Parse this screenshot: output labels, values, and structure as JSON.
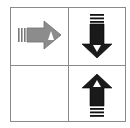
{
  "grid": {
    "rows": 2,
    "cols": 2,
    "border_color": "#8a8a8a",
    "background": "#ffffff"
  },
  "cells": [
    {
      "row": 0,
      "col": 0,
      "icon": "arrow-right-icon",
      "direction": "right",
      "fill": "#8c8c8c",
      "stroke": "#6e6e6e"
    },
    {
      "row": 0,
      "col": 1,
      "icon": "arrow-down-icon",
      "direction": "down",
      "fill": "#1a1a1a",
      "stroke": "#000000"
    },
    {
      "row": 1,
      "col": 0,
      "icon": "",
      "direction": "none"
    },
    {
      "row": 1,
      "col": 1,
      "icon": "arrow-up-icon",
      "direction": "up",
      "fill": "#1a1a1a",
      "stroke": "#000000"
    }
  ]
}
